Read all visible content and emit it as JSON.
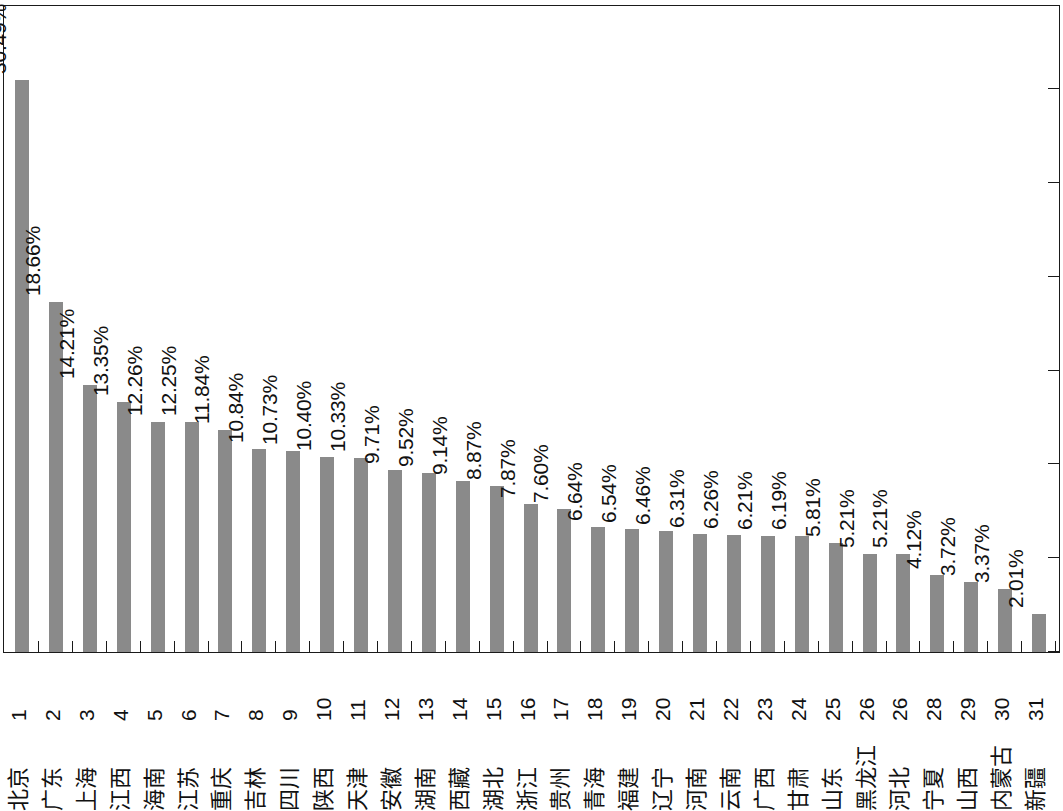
{
  "chart_data": {
    "type": "bar",
    "title": "",
    "subtitle": "",
    "xlabel": "",
    "ylabel": "",
    "orientation": "vertical",
    "grid": false,
    "legend": null,
    "value_suffix": "%",
    "ylim": [
      0,
      30.49
    ],
    "axis_ticks_labeled": false,
    "value_axis_position": "right",
    "value_axis_tick_count": 7,
    "categories": [
      "北京",
      "广东",
      "上海",
      "江西",
      "海南",
      "江苏",
      "重庆",
      "吉林",
      "四川",
      "陕西",
      "天津",
      "安徽",
      "湖南",
      "西藏",
      "湖北",
      "浙江",
      "贵州",
      "青海",
      "福建",
      "辽宁",
      "河南",
      "云南",
      "广西",
      "甘肃",
      "山东",
      "黑龙江",
      "河北",
      "宁夏",
      "山西",
      "内蒙古",
      "新疆"
    ],
    "ranks": [
      "1",
      "2",
      "3",
      "4",
      "5",
      "6",
      "7",
      "8",
      "9",
      "10",
      "11",
      "12",
      "13",
      "14",
      "15",
      "16",
      "17",
      "18",
      "19",
      "20",
      "21",
      "22",
      "23",
      "24",
      "25",
      "26",
      "26",
      "28",
      "29",
      "30",
      "31"
    ],
    "values": [
      30.49,
      18.66,
      14.21,
      13.35,
      12.26,
      12.25,
      11.84,
      10.84,
      10.73,
      10.4,
      10.33,
      9.71,
      9.52,
      9.14,
      8.87,
      7.87,
      7.6,
      6.64,
      6.54,
      6.46,
      6.31,
      6.26,
      6.21,
      6.19,
      5.81,
      5.21,
      5.21,
      4.12,
      3.72,
      3.37,
      2.01
    ],
    "value_labels": [
      "30.49%",
      "18.66%",
      "14.21%",
      "13.35%",
      "12.26%",
      "12.25%",
      "11.84%",
      "10.84%",
      "10.73%",
      "10.40%",
      "10.33%",
      "9.71%",
      "9.52%",
      "9.14%",
      "8.87%",
      "7.87%",
      "7.60%",
      "6.64%",
      "6.54%",
      "6.46%",
      "6.31%",
      "6.26%",
      "6.21%",
      "6.19%",
      "5.81%",
      "5.21%",
      "5.21%",
      "4.12%",
      "3.72%",
      "3.37%",
      "2.01%"
    ],
    "colors": {
      "bar": "#8a8a8a",
      "axis": "#1a1a1a",
      "text": "#111111",
      "background": "#ffffff"
    }
  }
}
